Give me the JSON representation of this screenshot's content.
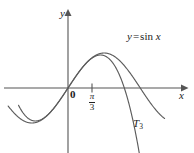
{
  "figure": {
    "width": 194,
    "height": 153,
    "background_color": "#ffffff",
    "curve_color": "#5c5c5c",
    "axis_color": "#555555",
    "text_color": "#222222"
  },
  "axes": {
    "x_axis_label": "x",
    "y_axis_label": "y",
    "origin_label": "0",
    "tick_labels": [
      {
        "name": "pi-over-three",
        "numerator": "π",
        "denominator": "3",
        "x_value": 1.0472
      }
    ],
    "x_range": [
      -2.6,
      4.2
    ],
    "y_range": [
      -2.0,
      1.55
    ],
    "grid": false
  },
  "labels": {
    "sine_curve": {
      "prefix": "y",
      "operator": "=",
      "function": "sin",
      "argument": "x",
      "full_text": "y = sin x"
    },
    "taylor_curve": {
      "base": "T",
      "subscript": "3",
      "full_text": "T₃"
    }
  },
  "chart_data": {
    "type": "line",
    "title": "",
    "xlabel": "x",
    "ylabel": "y",
    "xlim": [
      -2.6,
      4.2
    ],
    "ylim": [
      -2.0,
      1.55
    ],
    "grid": false,
    "legend_position": "inline-annotation",
    "series": [
      {
        "name": "y = sin x",
        "label": "y = sin x",
        "color": "#5c5c5c",
        "style": "solid",
        "x": [
          -2.6,
          -2.4,
          -2.2,
          -2.0,
          -1.8,
          -1.6,
          -1.4,
          -1.2,
          -1.0,
          -0.8,
          -0.6,
          -0.4,
          -0.2,
          0.0,
          0.2,
          0.4,
          0.6,
          0.8,
          1.0,
          1.2,
          1.4,
          1.5708,
          1.8,
          2.0,
          2.2,
          2.4,
          2.6,
          2.8,
          3.0,
          3.1416,
          3.3,
          3.5,
          3.7,
          3.9,
          4.1,
          4.2
        ],
        "y": [
          -0.5155,
          -0.6755,
          -0.8085,
          -0.9093,
          -0.9738,
          -0.9996,
          -0.9854,
          -0.932,
          -0.8415,
          -0.7174,
          -0.5646,
          -0.3894,
          -0.1987,
          0.0,
          0.1987,
          0.3894,
          0.5646,
          0.7174,
          0.8415,
          0.932,
          0.9854,
          1.0,
          0.9738,
          0.9093,
          0.8085,
          0.6755,
          0.5155,
          0.335,
          0.1411,
          0.0,
          -0.1577,
          -0.3508,
          -0.5298,
          -0.6878,
          -0.8183,
          -0.8716
        ]
      },
      {
        "name": "T3",
        "label": "T₃",
        "color": "#5c5c5c",
        "style": "solid",
        "description": "third-degree Taylor polynomial of sin x at 0: x - x^3/6",
        "x": [
          -1.95,
          -1.8,
          -1.6,
          -1.4,
          -1.2,
          -1.0,
          -0.8,
          -0.6,
          -0.4,
          -0.2,
          0.0,
          0.2,
          0.4,
          0.6,
          0.8,
          1.0,
          1.2,
          1.4,
          1.5708,
          1.8,
          2.0,
          2.2,
          2.4,
          2.6,
          2.8,
          3.0,
          3.1416,
          3.25
        ],
        "y": [
          -0.7142,
          -0.828,
          -0.9173,
          -0.9427,
          -0.912,
          -0.8333,
          -0.7147,
          -0.564,
          -0.3893,
          -0.1987,
          0.0,
          0.1987,
          0.3893,
          0.564,
          0.7147,
          0.8333,
          0.912,
          0.9427,
          0.9119,
          0.828,
          0.6667,
          0.4253,
          0.096,
          -0.3293,
          -0.8587,
          -1.5,
          -1.9248,
          -2.2318
        ]
      }
    ],
    "annotations": [
      {
        "name": "sine-label",
        "text": "y = sin x",
        "x": 2.25,
        "y": 1.18
      },
      {
        "name": "taylor-label",
        "text": "T₃",
        "x": 2.45,
        "y": -1.25
      },
      {
        "name": "origin-label",
        "text": "0",
        "x": 0.08,
        "y": -0.15
      },
      {
        "name": "tick-label",
        "text": "π/3",
        "x": 1.0472,
        "y": -0.32
      }
    ]
  }
}
